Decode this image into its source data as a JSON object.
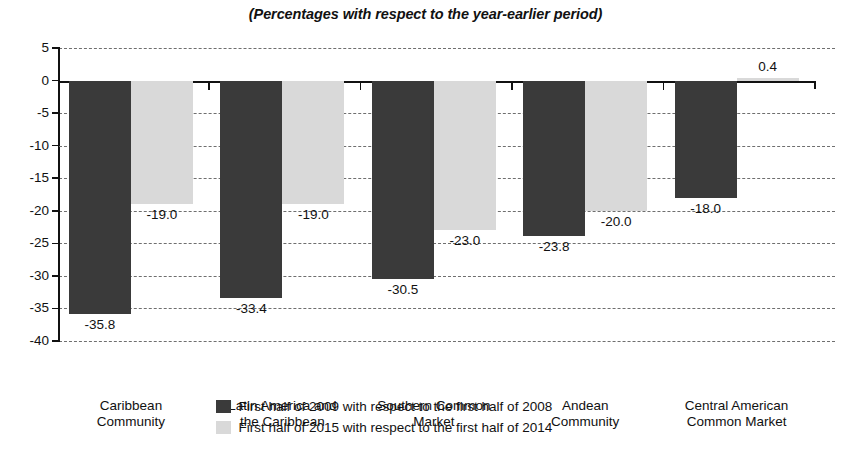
{
  "chart_data": {
    "type": "bar",
    "title": "(Percentages with respect to the year-earlier period)",
    "subtitle": "",
    "xlabel": "",
    "ylabel": "",
    "ylim": [
      -40,
      5
    ],
    "ytick_labels": [
      "5",
      "0",
      "-5",
      "-10",
      "-15",
      "-20",
      "-25",
      "-30",
      "-35",
      "-40"
    ],
    "ytick_values": [
      5,
      0,
      -5,
      -10,
      -15,
      -20,
      -25,
      -30,
      -35,
      -40
    ],
    "grid": "horizontal-dashed",
    "legend_position": "bottom-center",
    "categories": [
      "Caribbean\nCommunity",
      "Latin America and\nthe Caribbean",
      "Southern Common\nMarket",
      "Andean\nCommunity",
      "Central American\nCommon Market"
    ],
    "category_lines": [
      [
        "Caribbean",
        "Community"
      ],
      [
        "Latin America and",
        "the Caribbean"
      ],
      [
        "Southern Common",
        "Market"
      ],
      [
        "Andean",
        "Community"
      ],
      [
        "Central American",
        "Common Market"
      ]
    ],
    "series": [
      {
        "name": "First half of 2009 with respect to the first half of 2008",
        "color": "#3a3a3a",
        "values": [
          -35.8,
          -33.4,
          -30.5,
          -23.8,
          -18.0
        ],
        "labels": [
          "-35.8",
          "-33.4",
          "-30.5",
          "-23.8",
          "-18.0"
        ]
      },
      {
        "name": "First half of 2015 with respect to the first half of 2014",
        "color": "#d9d9d9",
        "values": [
          -19.0,
          -19.0,
          -23.0,
          -20.0,
          0.4
        ],
        "labels": [
          "-19.0",
          "-19.0",
          "-23.0",
          "-20.0",
          "0.4"
        ]
      }
    ]
  },
  "legend": {
    "items": [
      {
        "label": "First half of 2009 with respect to the first half of 2008",
        "swatch": "dark"
      },
      {
        "label": "First half of 2015 with respect to the first half of 2014",
        "swatch": "light"
      }
    ]
  },
  "colors": {
    "series_dark": "#3a3a3a",
    "series_light": "#d9d9d9",
    "axis": "#111111",
    "grid": "#6f6f6f",
    "background": "#ffffff"
  }
}
